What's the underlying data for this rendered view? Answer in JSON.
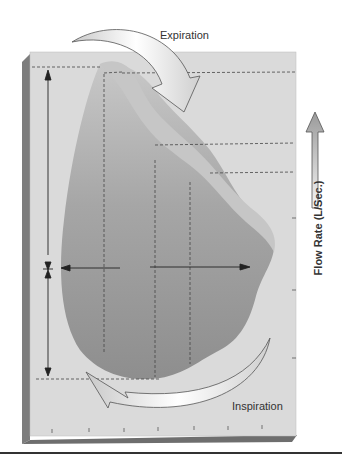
{
  "diagram": {
    "type": "flow-volume-loop",
    "labels": {
      "expiration": "Expiration",
      "inspiration": "Inspiration",
      "y_axis": "Flow Rate (L/Sec.)"
    },
    "colors": {
      "panel": "#dcdcdc",
      "panel_edge": "#8a8a8a",
      "loop_fill": "#9f9f9f",
      "loop_band": "#c4c4c4",
      "arrow_fill": "#efefef",
      "arrow_stroke": "#555555",
      "dashed": "#444444",
      "text": "#333333"
    },
    "x_axis_ticks": 7,
    "right_axis_ticks": 4
  }
}
